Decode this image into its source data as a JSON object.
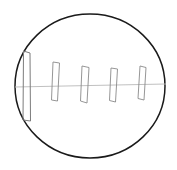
{
  "figure": {
    "canvas": {
      "width": 177,
      "height": 170,
      "background": "#ffffff"
    },
    "colors": {
      "outline": "#1a1a1a",
      "axis": "#b9b9b9",
      "blade": "#8a8a8a",
      "blade_primary": "#7c7c7c",
      "background": "#ffffff"
    },
    "housing": {
      "name": "housing-outline",
      "shape": "circle",
      "center_x": 90,
      "center_y": 86,
      "radius_x": 75,
      "radius_y": 72,
      "stroke_width": 1.5
    },
    "axis": {
      "name": "centerline-axis",
      "x1": 15,
      "y1": 87,
      "x2": 166,
      "y2": 84,
      "stroke_width": 0.9
    },
    "blades": [
      {
        "name": "blade-1",
        "index": 1,
        "top_y": 50,
        "bottom_y": 122,
        "points": "23.5,51 30,53 30.5,121 23,120"
      },
      {
        "name": "blade-2",
        "index": 2,
        "top_y": 62,
        "bottom_y": 101,
        "points": "53,62 59.5,63 57.5,101 51.5,100"
      },
      {
        "name": "blade-3",
        "index": 3,
        "top_y": 66,
        "bottom_y": 103,
        "points": "82,66 89,67.5 87,103 80.5,101"
      },
      {
        "name": "blade-4",
        "index": 4,
        "top_y": 68,
        "bottom_y": 102,
        "points": "111,68 117.5,69 115.5,102 109.5,100.5"
      },
      {
        "name": "blade-5",
        "index": 5,
        "top_y": 66,
        "bottom_y": 100,
        "points": "140,66 146,67.5 144,100 138,98.5"
      }
    ]
  }
}
